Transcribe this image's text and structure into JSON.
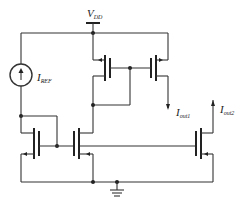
{
  "diagram": {
    "type": "circuit-schematic",
    "labels": {
      "vdd": {
        "main": "V",
        "sub": "DD"
      },
      "iref": {
        "main": "I",
        "sub": "REF"
      },
      "iout1": {
        "main": "I",
        "sub": "out1"
      },
      "iout2": {
        "main": "I",
        "sub": "out2"
      }
    },
    "components": [
      "current-source IREF",
      "NMOS M1 (diode)",
      "NMOS M2",
      "NMOS M3",
      "PMOS M4 (diode)",
      "PMOS M5",
      "ground"
    ],
    "colors": {
      "line": "#333333",
      "background": "#ffffff"
    }
  }
}
